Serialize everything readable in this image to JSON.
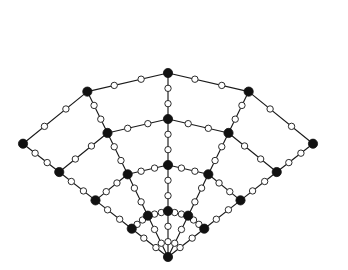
{
  "figure": {
    "background_color": "#ffffff",
    "edge_color": "#1a1a1a",
    "major_node_color": "#111111",
    "minor_node_fill": "#ffffff",
    "minor_node_stroke": "#2b2b2b",
    "major_node_radius": 4.6,
    "minor_node_radius": 3.2,
    "edge_width": 1.15,
    "subdivisions_per_edge": 2,
    "canvas": {
      "width": 348,
      "height": 270
    }
  },
  "chart_data": {
    "type": "scatter",
    "xlabel": "",
    "ylabel": "",
    "xlim": [
      0,
      348
    ],
    "ylim": [
      0,
      270
    ],
    "grid": false,
    "legend": null,
    "layout": {
      "mapping": "polar fan",
      "apex": [
        168,
        257
      ],
      "rows": 5,
      "cols": 5,
      "radii": [
        0,
        46,
        92,
        138,
        184
      ],
      "angles_deg": [
        -52,
        -26,
        0,
        26,
        52
      ]
    },
    "series": [
      {
        "name": "major nodes",
        "marker": "filled-circle",
        "points": [
          [
            168,
            257
          ],
          [
            132,
            228
          ],
          [
            156,
            212
          ],
          [
            180,
            212
          ],
          [
            204,
            228
          ],
          [
            103,
            193
          ],
          [
            137,
            170
          ],
          [
            168,
            162
          ],
          [
            199,
            170
          ],
          [
            233,
            193
          ],
          [
            68,
            116
          ],
          [
            120,
            168
          ],
          [
            211,
            170
          ],
          [
            272,
            117
          ],
          [
            22,
            93
          ],
          [
            65,
            56
          ],
          [
            105,
            79
          ],
          [
            165,
            117
          ],
          [
            174,
            15
          ],
          [
            215,
            24
          ],
          [
            275,
            47
          ],
          [
            331,
            92
          ],
          [
            160,
            65
          ],
          [
            128,
            23
          ],
          [
            236,
            63
          ],
          [
            310,
            122
          ]
        ]
      },
      {
        "name": "minor nodes",
        "marker": "open-circle",
        "note": "two per lattice edge, placed at 1/3 and 2/3 along each edge"
      }
    ]
  }
}
